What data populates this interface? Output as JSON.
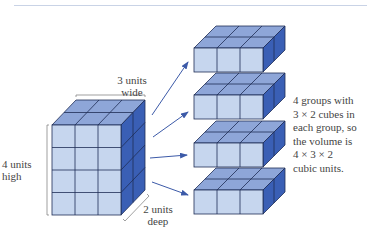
{
  "labels": {
    "width_line1": "3 units",
    "width_line2": "wide",
    "height_line1": "4 units",
    "height_line2": "high",
    "depth_line1": "2 units",
    "depth_line2": "deep"
  },
  "explanation": {
    "lines": [
      "4 groups with",
      "3 × 2 cubes in",
      "each group, so",
      "the volume is",
      "4 × 3 × 2",
      "cubic units."
    ]
  },
  "colors": {
    "front": "#c6d6ee",
    "top": "#8ea6d8",
    "side": "#3a5fb5",
    "edge": "#1f2d55",
    "arrow": "#3c5aa8"
  },
  "diagram": {
    "prism": {
      "width_units": 3,
      "height_units": 4,
      "depth_units": 2
    },
    "groups": 4,
    "group_cubes": "3 × 2"
  }
}
